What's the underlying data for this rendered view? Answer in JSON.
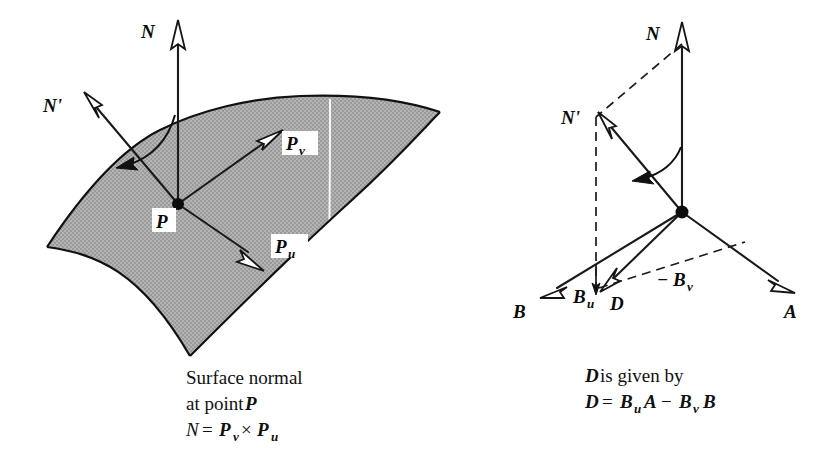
{
  "figure": {
    "background_color": "#ffffff",
    "ink_color": "#111111",
    "surface_fill_color": "#a9a9a9",
    "isoparm_color": "#ffffff"
  },
  "left_panel": {
    "name": "surface-normal-panel",
    "vectors": [
      {
        "id": "N",
        "label": "N",
        "subscript": "",
        "style": "solid",
        "head": "hollow-open"
      },
      {
        "id": "Np",
        "label": "N'",
        "subscript": "",
        "style": "solid",
        "head": "hollow-open"
      },
      {
        "id": "Pv",
        "label": "P",
        "subscript": "v",
        "style": "solid",
        "head": "hollow-open"
      },
      {
        "id": "Pu",
        "label": "P",
        "subscript": "u",
        "style": "solid",
        "head": "hollow-open"
      }
    ],
    "point_label": "P",
    "arc_annotation": "rotation-from-N-to-N-prime",
    "caption_lines": [
      {
        "parts": [
          {
            "text": "Surface normal",
            "style": "roman"
          }
        ]
      },
      {
        "parts": [
          {
            "text": "at point ",
            "style": "roman"
          },
          {
            "text": "P",
            "style": "bold-italic"
          }
        ]
      },
      {
        "parts": [
          {
            "text": "N",
            "style": "italic"
          },
          {
            "text": " = ",
            "style": "roman"
          },
          {
            "text": "P",
            "style": "bold-italic"
          },
          {
            "text": "v",
            "style": "sub"
          },
          {
            "text": " × ",
            "style": "roman"
          },
          {
            "text": "P",
            "style": "bold-italic"
          },
          {
            "text": "u",
            "style": "sub"
          }
        ]
      }
    ],
    "caption_plain": [
      "Surface normal",
      "at point P",
      "N = Pv × Pu"
    ]
  },
  "right_panel": {
    "name": "perturbation-vectors-panel",
    "vectors": [
      {
        "id": "N",
        "label": "N",
        "subscript": "",
        "style": "solid",
        "head": "hollow-open"
      },
      {
        "id": "Np",
        "label": "N'",
        "subscript": "",
        "style": "solid",
        "head": "hollow-open"
      },
      {
        "id": "A",
        "label": "A",
        "subscript": "",
        "style": "solid",
        "head": "hollow-open"
      },
      {
        "id": "B",
        "label": "B",
        "subscript": "",
        "style": "solid",
        "head": "hollow-open"
      },
      {
        "id": "D",
        "label": "D",
        "subscript": "",
        "style": "solid",
        "head": "hollow-open"
      },
      {
        "id": "Bu",
        "label": "B",
        "subscript": "u",
        "style": "solid",
        "head": "small-tick"
      },
      {
        "id": "mBv",
        "label": "− B",
        "subscript": "v",
        "style": "dashed",
        "head": "none"
      }
    ],
    "dashed_elements": [
      "N-to-Nprime-top-connector",
      "Nprime-vertical-drop",
      "minus-Bv-projection"
    ],
    "arc_annotation": "rotation-from-N-to-N-prime",
    "caption_lines": [
      {
        "parts": [
          {
            "text": "D",
            "style": "bold-italic"
          },
          {
            "text": " is given by",
            "style": "roman"
          }
        ]
      },
      {
        "parts": [
          {
            "text": "D",
            "style": "bold-italic"
          },
          {
            "text": " = ",
            "style": "roman"
          },
          {
            "text": "B",
            "style": "bold-italic"
          },
          {
            "text": "u",
            "style": "sub"
          },
          {
            "text": " A",
            "style": "bold-italic"
          },
          {
            "text": " − ",
            "style": "roman"
          },
          {
            "text": "B",
            "style": "bold-italic"
          },
          {
            "text": "v",
            "style": "sub"
          },
          {
            "text": " B",
            "style": "bold-italic"
          }
        ]
      }
    ],
    "caption_plain": [
      "D is given by",
      "D = Bu A − Bv B"
    ]
  },
  "labels": {
    "N": "N",
    "N_prime": "N'",
    "P": "P",
    "P_base": "P",
    "P_sub_v": "v",
    "P_sub_u": "u",
    "A": "A",
    "B": "B",
    "D": "D",
    "B_base": "B",
    "B_sub_u": "u",
    "minus": "−",
    "B_sub_v": "v",
    "times": "×",
    "equals": "=",
    "surface_normal_l1": "Surface normal",
    "surface_normal_l2a": "at point ",
    "surface_normal_l2b": "P",
    "d_given_by_a": "D",
    "d_given_by_b": " is given by"
  }
}
